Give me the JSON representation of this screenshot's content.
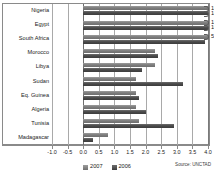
{
  "chart_data": {
    "type": "bar",
    "orientation": "horizontal",
    "title": "",
    "xlabel": "",
    "ylabel": "",
    "xlim": [
      -1.0,
      4.0
    ],
    "xticks": [
      -1.0,
      -0.5,
      0.0,
      0.5,
      1.0,
      1.5,
      2.0,
      2.5,
      3.0,
      3.5,
      4.0
    ],
    "xticklabels": [
      "-1.0",
      "-0.5",
      "0.0",
      "0.5",
      "1.0",
      "1.5",
      "2.0",
      "2.5",
      "3.0",
      "3.5",
      "4.0"
    ],
    "grid": true,
    "broken_axis": true,
    "legend_position": "bottom-center",
    "categories": [
      "Nigeria",
      "Egypt",
      "South Africa",
      "Morocco",
      "Libya",
      "Sudan",
      "Eq. Guinea",
      "Algeria",
      "Tunisia",
      "Madagascar"
    ],
    "series": [
      {
        "name": "2007",
        "color": "#7d7d7d",
        "values": [
          12.5,
          11.6,
          5.7,
          2.3,
          2.3,
          1.7,
          1.7,
          1.7,
          1.8,
          0.8
        ]
      },
      {
        "name": "2006",
        "color": "#4a4a4a",
        "values": [
          14.0,
          10.0,
          3.9,
          2.4,
          1.9,
          3.2,
          1.8,
          2.0,
          2.9,
          0.3
        ]
      }
    ],
    "offscale_labels": [
      "12.5",
      "14.0",
      "11.6",
      "10.0",
      "5.7"
    ],
    "annotations": [
      "Source: UNCTAD"
    ]
  },
  "legend": {
    "items": [
      {
        "label": "2007"
      },
      {
        "label": "2006"
      }
    ]
  },
  "source": {
    "text": "Source: UNCTAD"
  }
}
